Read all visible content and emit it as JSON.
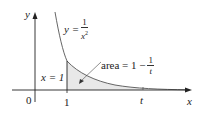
{
  "axes": {
    "x_label": "x",
    "y_label": "y",
    "origin_label": "0"
  },
  "curve": {
    "label_lhs": "y =",
    "label_num": "1",
    "label_den": "x",
    "label_exp": "2"
  },
  "vertical_line": {
    "label": "x = 1",
    "tick_label": "1"
  },
  "area": {
    "label_prefix": "area = 1 −",
    "label_num": "1",
    "label_den": "t"
  },
  "t_tick": {
    "label": "t"
  },
  "colors": {
    "curve": "#555555",
    "shade": "#e6e6e6",
    "axis": "#222222"
  }
}
